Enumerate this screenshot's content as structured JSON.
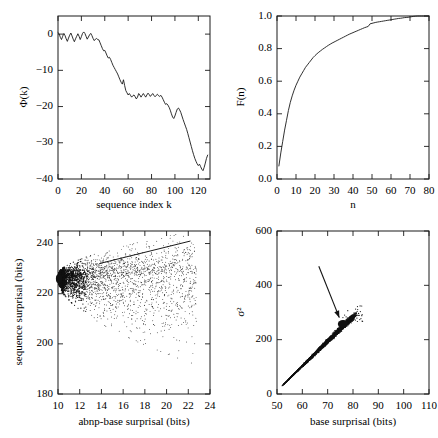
{
  "figure": {
    "name": "four-panel-surprisal-figure",
    "background": "#ffffff",
    "ink": "#1a1a1a"
  },
  "chart_data": [
    {
      "id": "phi-k",
      "type": "line",
      "title": "",
      "xlabel": "sequence index k",
      "ylabel": "Φ(k)",
      "xlim": [
        0,
        130
      ],
      "ylim": [
        -40,
        5
      ],
      "xticks": [
        0,
        20,
        40,
        60,
        80,
        100,
        120
      ],
      "yticks": [
        0,
        -10,
        -20,
        -30,
        -40
      ],
      "xticklabels": [
        "0",
        "20",
        "40",
        "60",
        "80",
        "100",
        "120"
      ],
      "yticklabels": [
        "0",
        "−10",
        "−20",
        "−30",
        "−40"
      ],
      "grid": false,
      "legend": "none",
      "x": [
        0,
        1,
        2,
        3,
        4,
        5,
        6,
        7,
        8,
        9,
        10,
        11,
        12,
        13,
        14,
        15,
        16,
        17,
        18,
        19,
        20,
        21,
        22,
        23,
        24,
        25,
        26,
        27,
        28,
        29,
        30,
        31,
        32,
        33,
        34,
        35,
        36,
        37,
        38,
        39,
        40,
        41,
        42,
        43,
        44,
        45,
        46,
        47,
        48,
        49,
        50,
        51,
        52,
        53,
        54,
        55,
        56,
        57,
        58,
        59,
        60,
        61,
        62,
        63,
        64,
        65,
        66,
        67,
        68,
        69,
        70,
        71,
        72,
        73,
        74,
        75,
        76,
        77,
        78,
        79,
        80,
        81,
        82,
        83,
        84,
        85,
        86,
        87,
        88,
        89,
        90,
        91,
        92,
        93,
        94,
        95,
        96,
        97,
        98,
        99,
        100,
        101,
        102,
        103,
        104,
        105,
        106,
        107,
        108,
        109,
        110,
        111,
        112,
        113,
        114,
        115,
        116,
        117,
        118,
        119,
        120,
        121,
        122,
        123,
        124,
        125,
        126,
        127,
        128,
        129,
        130
      ],
      "y": [
        0.4,
        0.1,
        -0.9,
        -1.5,
        -0.6,
        0.2,
        -0.4,
        -1.3,
        -2.0,
        -1.1,
        -0.3,
        0.3,
        -0.5,
        -1.4,
        -2.1,
        -1.3,
        -0.6,
        0.1,
        -0.6,
        -1.5,
        -0.7,
        0.2,
        0.6,
        0.2,
        -0.6,
        -1.4,
        -0.8,
        -0.2,
        0.2,
        -0.4,
        -1.2,
        -1.8,
        -1.4,
        -1.2,
        -1.5,
        -1.6,
        -2.4,
        -3.2,
        -4.0,
        -4.6,
        -4.5,
        -5.2,
        -6.0,
        -6.6,
        -6.4,
        -7.0,
        -7.8,
        -8.6,
        -9.2,
        -9.8,
        -10.4,
        -11.0,
        -11.8,
        -12.6,
        -13.3,
        -13.8,
        -12.6,
        -14.2,
        -15.6,
        -16.2,
        -16.8,
        -16.4,
        -16.9,
        -17.4,
        -17.0,
        -16.8,
        -17.3,
        -17.9,
        -17.4,
        -16.4,
        -16.8,
        -17.4,
        -16.9,
        -16.4,
        -16.9,
        -17.4,
        -16.8,
        -16.3,
        -16.7,
        -17.2,
        -16.8,
        -16.4,
        -16.9,
        -17.3,
        -16.9,
        -16.6,
        -17.0,
        -17.2,
        -16.9,
        -17.4,
        -18.1,
        -18.8,
        -19.4,
        -19.2,
        -19.6,
        -20.2,
        -21.0,
        -22.0,
        -22.9,
        -23.3,
        -22.6,
        -21.6,
        -20.7,
        -20.4,
        -20.9,
        -21.6,
        -22.6,
        -23.6,
        -24.5,
        -25.4,
        -26.3,
        -27.4,
        -28.6,
        -29.8,
        -31.0,
        -32.2,
        -33.3,
        -34.3,
        -35.1,
        -35.8,
        -36.3,
        -35.9,
        -36.6,
        -37.3,
        -37.7,
        -36.8,
        -35.6,
        -34.3,
        -33.4
      ]
    },
    {
      "id": "F-n",
      "type": "line",
      "title": "",
      "xlabel": "n",
      "ylabel": "F(n)",
      "xlim": [
        0,
        80
      ],
      "ylim": [
        0.0,
        1.0
      ],
      "xticks": [
        0,
        10,
        20,
        30,
        40,
        50,
        60,
        70,
        80
      ],
      "yticks": [
        0.0,
        0.2,
        0.4,
        0.6,
        0.8,
        1.0
      ],
      "xticklabels": [
        "0",
        "10",
        "20",
        "30",
        "40",
        "50",
        "60",
        "70",
        "80"
      ],
      "yticklabels": [
        "0.0",
        "0.2",
        "0.4",
        "0.6",
        "0.8",
        "1.0"
      ],
      "grid": false,
      "legend": "none",
      "x": [
        1,
        2,
        3,
        4,
        5,
        6,
        7,
        8,
        9,
        10,
        11,
        12,
        13,
        14,
        15,
        16,
        17,
        18,
        19,
        20,
        21,
        22,
        23,
        24,
        25,
        26,
        27,
        28,
        29,
        30,
        31,
        32,
        33,
        34,
        35,
        36,
        37,
        38,
        39,
        40,
        41,
        42,
        43,
        44,
        45,
        46,
        47,
        48,
        49,
        50,
        51,
        52,
        53,
        54,
        55,
        56,
        57,
        58,
        59,
        60,
        61,
        62,
        63,
        64,
        65,
        66,
        67,
        68,
        69,
        70,
        71,
        72,
        73,
        74,
        75,
        76,
        77,
        78,
        79,
        80
      ],
      "y": [
        0.08,
        0.16,
        0.23,
        0.3,
        0.36,
        0.42,
        0.47,
        0.51,
        0.545,
        0.575,
        0.6,
        0.625,
        0.645,
        0.665,
        0.685,
        0.7,
        0.715,
        0.73,
        0.745,
        0.757,
        0.768,
        0.778,
        0.787,
        0.796,
        0.804,
        0.812,
        0.82,
        0.827,
        0.834,
        0.84,
        0.846,
        0.852,
        0.858,
        0.864,
        0.87,
        0.876,
        0.882,
        0.888,
        0.893,
        0.898,
        0.903,
        0.908,
        0.913,
        0.918,
        0.923,
        0.928,
        0.932,
        0.936,
        0.952,
        0.955,
        0.958,
        0.961,
        0.963,
        0.965,
        0.967,
        0.969,
        0.971,
        0.973,
        0.975,
        0.977,
        0.979,
        0.981,
        0.983,
        0.985,
        0.986,
        0.988,
        0.99,
        0.991,
        0.992,
        0.994,
        0.996,
        0.998,
        0.999,
        1.0,
        1.0,
        1.0,
        1.0,
        1.0,
        1.0,
        1.0
      ]
    },
    {
      "id": "sequence-vs-abnp",
      "type": "scatter",
      "title": "",
      "xlabel": "abnp-base surprisal (bits)",
      "ylabel": "sequence surprisal (bits)",
      "xlim": [
        10,
        24
      ],
      "ylim": [
        180,
        245
      ],
      "xticks": [
        10,
        12,
        14,
        16,
        18,
        20,
        22,
        24
      ],
      "yticks": [
        180,
        200,
        220,
        240
      ],
      "xticklabels": [
        "10",
        "12",
        "14",
        "16",
        "18",
        "20",
        "22",
        "24"
      ],
      "yticklabels": [
        "180",
        "200",
        "220",
        "240"
      ],
      "grid": false,
      "legend": "none",
      "n_points": 3000,
      "cluster": {
        "x": 10.1,
        "y": 226.0,
        "note": "dense apex at left edge"
      },
      "fan": {
        "x_start": 10.1,
        "y_center": 226.0,
        "x_end": 22.5,
        "y_upper": 241.5,
        "y_lower": 190.0
      },
      "fit_line": {
        "x0": 13.8,
        "y0": 232.0,
        "x1": 22.2,
        "y1": 241.0
      }
    },
    {
      "id": "variance-vs-base",
      "type": "scatter",
      "title": "",
      "xlabel": "base surprisal (bits)",
      "ylabel": "σ²",
      "xlim": [
        50,
        110
      ],
      "ylim": [
        0,
        600
      ],
      "xticks": [
        50,
        60,
        70,
        80,
        90,
        100,
        110
      ],
      "yticks": [
        0,
        200,
        400,
        600
      ],
      "xticklabels": [
        "50",
        "60",
        "70",
        "80",
        "90",
        "100",
        "110"
      ],
      "yticklabels": [
        "0",
        "200",
        "400",
        "600"
      ],
      "grid": false,
      "legend": "none",
      "n_points": 2600,
      "streak": {
        "x_start": 52.0,
        "y_start": 30.0,
        "x_end": 80.0,
        "y_end": 285.0
      },
      "blob": {
        "x": 76.0,
        "y": 258.0,
        "rx": 2.0,
        "ry": 14.0
      },
      "annotation": {
        "type": "arrow",
        "x_tail": 66.5,
        "y_tail": 470.0,
        "x_head": 74.6,
        "y_head": 281.0
      }
    }
  ]
}
